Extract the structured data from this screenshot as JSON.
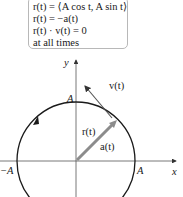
{
  "equations": {
    "lines": [
      "r(t) = ⟨A cos t, A sin t⟩",
      "r(t) = −a(t)",
      "r(t) · v(t) = 0",
      "at all times"
    ]
  },
  "diagram": {
    "axes": {
      "x_label": "x",
      "y_label": "y"
    },
    "circle_labels": {
      "top": "A",
      "left": "−A",
      "right": "A"
    },
    "vectors": {
      "position": "r(t)",
      "acceleration": "a(t)",
      "velocity": "v(t)"
    },
    "colors": {
      "axis": "#333333",
      "circle": "#1a1a1a",
      "position_vector": "#8c8c8c",
      "box_border": "#b8b8b8"
    }
  }
}
